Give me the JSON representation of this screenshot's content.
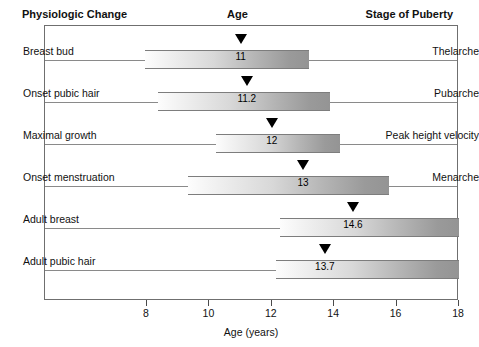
{
  "headers": {
    "left": "Physiologic Change",
    "middle": "Age",
    "right": "Stage of Puberty"
  },
  "axis": {
    "title": "Age (years)",
    "ticks": [
      8,
      10,
      12,
      14,
      16,
      18
    ],
    "tick_labels": [
      "8",
      "10",
      "12",
      "14",
      "16",
      "18"
    ],
    "min": 7,
    "max": 18
  },
  "chart_data": {
    "type": "bar",
    "title": "Age",
    "xlabel": "Age (years)",
    "ylabel": "Physiologic Change",
    "xlim": [
      7,
      18
    ],
    "grid": false,
    "legend": false,
    "orientation": "horizontal",
    "categories": [
      "Breast bud",
      "Onset pubic hair",
      "Maximal growth",
      "Onset menstruation",
      "Adult breast",
      "Adult pubic hair"
    ],
    "stage_labels": [
      "Thelarche",
      "Pubarche",
      "Peak height velocity",
      "Menarche",
      "",
      ""
    ],
    "values": [
      11,
      11.2,
      12,
      13,
      14.6,
      13.7
    ],
    "value_labels": [
      "11",
      "11.2",
      "12",
      "13",
      "14.6",
      "13.7"
    ],
    "ranges": [
      {
        "start": 7.95,
        "end": 13.2
      },
      {
        "start": 8.35,
        "end": 13.85
      },
      {
        "start": 10.2,
        "end": 14.2
      },
      {
        "start": 9.3,
        "end": 15.75
      },
      {
        "start": 12.25,
        "end": 18
      },
      {
        "start": 12.15,
        "end": 18
      }
    ]
  },
  "rows": [
    {
      "label": "Breast bud",
      "stage": "Thelarche",
      "value": "11",
      "marker": 11,
      "start": 7.95,
      "end": 13.2
    },
    {
      "label": "Onset pubic hair",
      "stage": "Pubarche",
      "value": "11.2",
      "marker": 11.2,
      "start": 8.35,
      "end": 13.85
    },
    {
      "label": "Maximal growth",
      "stage": "Peak height velocity",
      "value": "12",
      "marker": 12,
      "start": 10.2,
      "end": 14.2
    },
    {
      "label": "Onset menstruation",
      "stage": "Menarche",
      "value": "13",
      "marker": 13,
      "start": 9.3,
      "end": 15.75
    },
    {
      "label": "Adult breast",
      "stage": "",
      "value": "14.6",
      "marker": 14.6,
      "start": 12.25,
      "end": 18
    },
    {
      "label": "Adult pubic hair",
      "stage": "",
      "value": "13.7",
      "marker": 13.7,
      "start": 12.15,
      "end": 18
    }
  ],
  "colors": {
    "frame": "#6f6f6f",
    "rule": "#8a8a8a",
    "marker": "#000000",
    "bar_light": "#fdfdfd",
    "bar_dark": "#949494",
    "text": "#111111"
  }
}
